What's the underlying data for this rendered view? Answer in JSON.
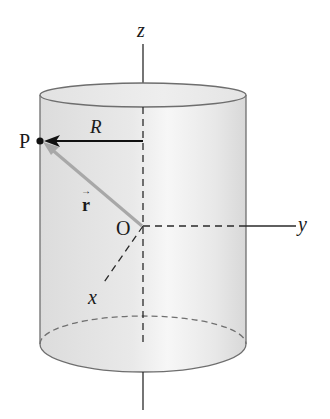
{
  "figure": {
    "colors": {
      "cylinder_fill": "#e6e6e6",
      "cylinder_edge": "#6e6e6e",
      "axis": "#2a2a2a",
      "radius_arrow": "#111111",
      "r_vector": "#a8a8a8",
      "point": "#111111"
    }
  },
  "labels": {
    "z_axis": "z",
    "y_axis": "y",
    "x_axis": "x",
    "origin": "O",
    "point": "P",
    "radius": "R",
    "vector_r": "r",
    "vector_arrow": "→"
  }
}
